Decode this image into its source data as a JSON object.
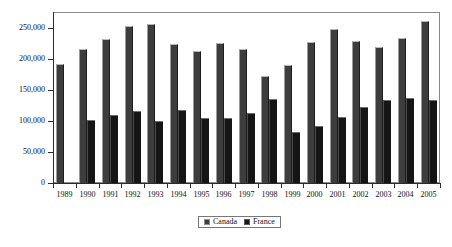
{
  "chart_data": {
    "type": "bar",
    "title": "",
    "xlabel": "",
    "ylabel": "",
    "grid": false,
    "legend_position": "bottom-center",
    "ylim": [
      0,
      275000
    ],
    "yticks": [
      0,
      50000,
      100000,
      150000,
      200000,
      250000
    ],
    "ytick_labels": [
      "0",
      "50,000",
      "100,000",
      "150,000",
      "200,000",
      "250,000"
    ],
    "categories": [
      "1989",
      "1990",
      "1991",
      "1992",
      "1993",
      "1994",
      "1995",
      "1996",
      "1997",
      "1998",
      "1999",
      "2000",
      "2001",
      "2002",
      "2003",
      "2004",
      "2005"
    ],
    "series": [
      {
        "name": "Canada",
        "color": "#3d3d3d",
        "values": [
          191000,
          216000,
          232000,
          253000,
          255000,
          224000,
          212000,
          225000,
          215000,
          172000,
          189000,
          226000,
          248000,
          228000,
          219000,
          233000,
          260000
        ]
      },
      {
        "name": "France",
        "color": "#151515",
        "values": [
          null,
          102000,
          109000,
          116000,
          99000,
          118000,
          104000,
          104000,
          113000,
          135000,
          82000,
          92000,
          106000,
          123000,
          134000,
          137000,
          134000
        ]
      }
    ]
  },
  "legend": {
    "entries": [
      {
        "label": "Canada",
        "swatch": "legend-swatch-canada"
      },
      {
        "label": "France",
        "swatch": "legend-swatch-france"
      }
    ]
  },
  "caption": {
    "sliver_text": ""
  }
}
